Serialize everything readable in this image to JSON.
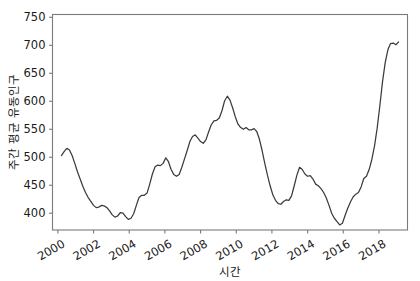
{
  "chart_data": {
    "type": "line",
    "title": "",
    "xlabel": "시간",
    "ylabel": "주간 평균 유동인구",
    "xlim": [
      1999.7,
      2019.6
    ],
    "ylim": [
      370,
      755
    ],
    "grid": false,
    "legend": null,
    "xticks": [
      2000,
      2002,
      2004,
      2006,
      2008,
      2010,
      2012,
      2014,
      2016,
      2018
    ],
    "xtick_labels": [
      "2000",
      "2002",
      "2004",
      "2006",
      "2008",
      "2010",
      "2012",
      "2014",
      "2016",
      "2018"
    ],
    "xtick_rotation_deg": 30,
    "yticks": [
      400,
      450,
      500,
      550,
      600,
      650,
      700,
      750
    ],
    "ytick_labels": [
      "400",
      "450",
      "500",
      "550",
      "600",
      "650",
      "700",
      "750"
    ],
    "line_color": "#3b3b3b",
    "series": [
      {
        "name": "주간 평균 유동인구",
        "x": [
          2000.2,
          2000.35,
          2000.5,
          2000.65,
          2000.8,
          2000.95,
          2001.1,
          2001.25,
          2001.4,
          2001.55,
          2001.7,
          2001.85,
          2002.0,
          2002.15,
          2002.3,
          2002.45,
          2002.6,
          2002.75,
          2002.9,
          2003.05,
          2003.2,
          2003.35,
          2003.5,
          2003.65,
          2003.8,
          2003.95,
          2004.1,
          2004.25,
          2004.4,
          2004.55,
          2004.7,
          2004.85,
          2005.0,
          2005.15,
          2005.3,
          2005.45,
          2005.6,
          2005.75,
          2005.9,
          2006.05,
          2006.2,
          2006.35,
          2006.5,
          2006.65,
          2006.8,
          2006.95,
          2007.1,
          2007.25,
          2007.4,
          2007.55,
          2007.7,
          2007.85,
          2008.0,
          2008.15,
          2008.3,
          2008.45,
          2008.6,
          2008.75,
          2008.9,
          2009.05,
          2009.2,
          2009.35,
          2009.5,
          2009.65,
          2009.8,
          2009.95,
          2010.1,
          2010.25,
          2010.4,
          2010.55,
          2010.7,
          2010.85,
          2011.0,
          2011.15,
          2011.3,
          2011.45,
          2011.6,
          2011.75,
          2011.9,
          2012.05,
          2012.2,
          2012.35,
          2012.5,
          2012.65,
          2012.8,
          2012.95,
          2013.1,
          2013.25,
          2013.4,
          2013.55,
          2013.7,
          2013.85,
          2014.0,
          2014.15,
          2014.3,
          2014.45,
          2014.6,
          2014.75,
          2014.9,
          2015.05,
          2015.2,
          2015.35,
          2015.5,
          2015.65,
          2015.8,
          2015.95,
          2016.1,
          2016.25,
          2016.4,
          2016.55,
          2016.7,
          2016.85,
          2017.0,
          2017.15,
          2017.3,
          2017.45,
          2017.6,
          2017.75,
          2017.9,
          2018.05,
          2018.2,
          2018.35,
          2018.5,
          2018.65,
          2018.8,
          2018.95,
          2019.1
        ],
        "y": [
          503,
          510,
          516,
          513,
          503,
          489,
          474,
          461,
          448,
          437,
          428,
          421,
          414,
          410,
          411,
          414,
          413,
          410,
          404,
          397,
          393,
          395,
          401,
          400,
          394,
          389,
          391,
          399,
          414,
          428,
          432,
          432,
          436,
          452,
          470,
          483,
          486,
          485,
          489,
          499,
          492,
          478,
          469,
          466,
          469,
          482,
          497,
          512,
          528,
          537,
          540,
          534,
          528,
          525,
          531,
          545,
          558,
          565,
          566,
          570,
          583,
          601,
          609,
          602,
          588,
          572,
          559,
          553,
          550,
          553,
          549,
          549,
          551,
          546,
          532,
          512,
          489,
          468,
          449,
          433,
          423,
          417,
          416,
          421,
          424,
          423,
          431,
          449,
          468,
          482,
          478,
          470,
          466,
          467,
          461,
          452,
          449,
          444,
          437,
          427,
          414,
          400,
          391,
          385,
          379,
          382,
          396,
          409,
          420,
          429,
          434,
          437,
          447,
          462,
          466,
          478,
          496,
          520,
          552,
          592,
          635,
          669,
          692,
          703,
          704,
          701,
          706
        ]
      }
    ],
    "annotations": {
      "global_max": {
        "x": 2018.78,
        "y": 735
      },
      "global_min": {
        "x": 2015.8,
        "y": 378
      },
      "end_value": {
        "x": 2019.25,
        "y": 703
      }
    }
  },
  "axes": {
    "ylabel_text": "주간 평균 유동인구",
    "xlabel_text": "시간"
  }
}
